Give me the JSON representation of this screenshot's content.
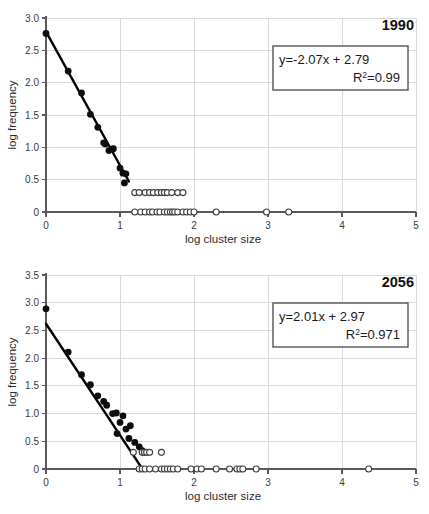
{
  "figure": {
    "background_color": "#ffffff",
    "panel_count": 2
  },
  "chart_data": [
    {
      "id": "panel-1990",
      "type": "scatter",
      "title": "1990",
      "xlabel": "log cluster size",
      "ylabel": "log frequency",
      "xlim": [
        0,
        5
      ],
      "ylim": [
        0,
        3.0
      ],
      "xticks": [
        0,
        1,
        2,
        3,
        4,
        5
      ],
      "xticklabels": [
        "0",
        "1",
        "2",
        "3",
        "4",
        "5"
      ],
      "yticks": [
        0,
        0.5,
        1.0,
        1.5,
        2.0,
        2.5,
        3.0
      ],
      "yticklabels": [
        "0",
        "0.5",
        "1.0",
        "1.5",
        "2.0",
        "2.5",
        "3.0"
      ],
      "grid": "horizontal-and-vertical",
      "legend": "none",
      "annotation": {
        "equation": "y=-2.07x + 2.79",
        "r_squared_label": "R",
        "r_squared_sup": "2",
        "r_squared_value": "=0.99",
        "boxed": true
      },
      "fit_line": {
        "slope": -2.07,
        "intercept": 2.79,
        "x_start": 0.0,
        "x_end": 1.12
      },
      "series": [
        {
          "name": "fitted points",
          "marker": "filled-circle",
          "color": "#0d0d0d",
          "points": [
            [
              0.0,
              2.76
            ],
            [
              0.3,
              2.18
            ],
            [
              0.48,
              1.84
            ],
            [
              0.6,
              1.51
            ],
            [
              0.7,
              1.31
            ],
            [
              0.78,
              1.07
            ],
            [
              0.8,
              1.05
            ],
            [
              0.85,
              0.95
            ],
            [
              0.9,
              0.97
            ],
            [
              0.91,
              0.98
            ],
            [
              1.0,
              0.68
            ],
            [
              1.04,
              0.6
            ],
            [
              1.08,
              0.59
            ],
            [
              1.06,
              0.45
            ]
          ]
        },
        {
          "name": "tail points (log f = 0.30)",
          "marker": "open-circle",
          "color": "#3d3d3d",
          "points": [
            [
              1.2,
              0.3
            ],
            [
              1.26,
              0.3
            ],
            [
              1.34,
              0.3
            ],
            [
              1.4,
              0.3
            ],
            [
              1.45,
              0.3
            ],
            [
              1.51,
              0.3
            ],
            [
              1.56,
              0.3
            ],
            [
              1.6,
              0.3
            ],
            [
              1.64,
              0.3
            ],
            [
              1.7,
              0.3
            ],
            [
              1.78,
              0.3
            ],
            [
              1.85,
              0.3
            ]
          ]
        },
        {
          "name": "singleton points (log f = 0)",
          "marker": "open-circle",
          "color": "#3d3d3d",
          "points": [
            [
              1.2,
              0.0
            ],
            [
              1.28,
              0.0
            ],
            [
              1.34,
              0.0
            ],
            [
              1.4,
              0.0
            ],
            [
              1.44,
              0.0
            ],
            [
              1.5,
              0.0
            ],
            [
              1.54,
              0.0
            ],
            [
              1.6,
              0.0
            ],
            [
              1.64,
              0.0
            ],
            [
              1.68,
              0.0
            ],
            [
              1.71,
              0.0
            ],
            [
              1.74,
              0.0
            ],
            [
              1.78,
              0.0
            ],
            [
              1.85,
              0.0
            ],
            [
              1.9,
              0.0
            ],
            [
              1.95,
              0.0
            ],
            [
              2.0,
              0.0
            ],
            [
              2.3,
              0.0
            ],
            [
              2.98,
              0.0
            ],
            [
              3.28,
              0.0
            ]
          ]
        }
      ]
    },
    {
      "id": "panel-2056",
      "type": "scatter",
      "title": "2056",
      "xlabel": "log cluster size",
      "ylabel": "log frequency",
      "xlim": [
        0,
        5
      ],
      "ylim": [
        0,
        3.5
      ],
      "xticks": [
        0,
        1,
        2,
        3,
        4,
        5
      ],
      "xticklabels": [
        "0",
        "1",
        "2",
        "3",
        "4",
        "5"
      ],
      "yticks": [
        0,
        0.5,
        1.0,
        1.5,
        2.0,
        2.5,
        3.0,
        3.5
      ],
      "yticklabels": [
        "0",
        "0.5",
        "1.0",
        "1.5",
        "2.0",
        "2.5",
        "3.0",
        "3.5"
      ],
      "grid": "horizontal-and-vertical",
      "legend": "none",
      "annotation": {
        "equation": "y=2.01x + 2.97",
        "r_squared_label": "R",
        "r_squared_sup": "2",
        "r_squared_value": "=0.971",
        "boxed": true
      },
      "fit_line": {
        "slope": -2.01,
        "intercept": 2.62,
        "x_start": 0.0,
        "x_end": 1.3
      },
      "series": [
        {
          "name": "fitted points",
          "marker": "filled-circle",
          "color": "#0d0d0d",
          "points": [
            [
              0.0,
              2.89
            ],
            [
              0.3,
              2.11
            ],
            [
              0.48,
              1.7
            ],
            [
              0.6,
              1.52
            ],
            [
              0.7,
              1.32
            ],
            [
              0.78,
              1.22
            ],
            [
              0.82,
              1.15
            ],
            [
              0.9,
              1.0
            ],
            [
              0.95,
              1.01
            ],
            [
              0.96,
              0.64
            ],
            [
              1.04,
              0.96
            ],
            [
              1.0,
              0.84
            ],
            [
              1.08,
              0.72
            ],
            [
              1.14,
              0.78
            ],
            [
              1.12,
              0.55
            ],
            [
              1.2,
              0.48
            ],
            [
              1.26,
              0.4
            ],
            [
              1.3,
              0.33
            ]
          ]
        },
        {
          "name": "tail points (log f = 0.30)",
          "marker": "open-circle",
          "color": "#3d3d3d",
          "points": [
            [
              1.18,
              0.3
            ],
            [
              1.3,
              0.3
            ],
            [
              1.33,
              0.3
            ],
            [
              1.36,
              0.3
            ],
            [
              1.4,
              0.3
            ],
            [
              1.56,
              0.3
            ]
          ]
        },
        {
          "name": "singleton points (log f = 0)",
          "marker": "open-circle",
          "color": "#3d3d3d",
          "points": [
            [
              1.26,
              0.0
            ],
            [
              1.3,
              0.0
            ],
            [
              1.34,
              0.0
            ],
            [
              1.4,
              0.0
            ],
            [
              1.48,
              0.0
            ],
            [
              1.56,
              0.0
            ],
            [
              1.6,
              0.0
            ],
            [
              1.64,
              0.0
            ],
            [
              1.68,
              0.0
            ],
            [
              1.72,
              0.0
            ],
            [
              1.78,
              0.0
            ],
            [
              1.96,
              0.0
            ],
            [
              2.04,
              0.0
            ],
            [
              2.1,
              0.0
            ],
            [
              2.3,
              0.0
            ],
            [
              2.48,
              0.0
            ],
            [
              2.58,
              0.0
            ],
            [
              2.62,
              0.0
            ],
            [
              2.66,
              0.0
            ],
            [
              2.84,
              0.0
            ],
            [
              4.36,
              0.0
            ]
          ]
        }
      ]
    }
  ]
}
